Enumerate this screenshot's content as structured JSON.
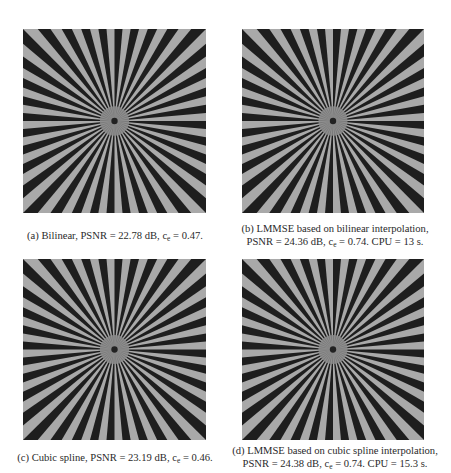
{
  "figure": {
    "panels": [
      {
        "id": "a",
        "image_label": "Siemens star test pattern reconstructed with bilinear interpolation",
        "caption_line1_pre": "(a) Bilinear, PSNR = 22.78 dB, c",
        "caption_line1_sub": "e",
        "caption_line1_post": " = 0.47.",
        "caption_line2_pre": "",
        "caption_line2_sub": "",
        "caption_line2_post": ""
      },
      {
        "id": "b",
        "image_label": "Siemens star test pattern reconstructed with LMMSE based on bilinear interpolation",
        "caption_line1_pre": "(b) LMMSE based on bilinear interpolation,",
        "caption_line1_sub": "",
        "caption_line1_post": "",
        "caption_line2_pre": "PSNR = 24.36 dB, c",
        "caption_line2_sub": "e",
        "caption_line2_post": " = 0.74. CPU = 13 s."
      },
      {
        "id": "c",
        "image_label": "Siemens star test pattern reconstructed with cubic spline interpolation",
        "caption_line1_pre": "(c) Cubic spline, PSNR = 23.19 dB, c",
        "caption_line1_sub": "e",
        "caption_line1_post": " = 0.46.",
        "caption_line2_pre": "",
        "caption_line2_sub": "",
        "caption_line2_post": ""
      },
      {
        "id": "d",
        "image_label": "Siemens star test pattern reconstructed with LMMSE based on cubic spline interpolation",
        "caption_line1_pre": "(d) LMMSE based on cubic spline interpolation,",
        "caption_line1_sub": "",
        "caption_line1_post": "",
        "caption_line2_pre": "PSNR = 24.38 dB, c",
        "caption_line2_sub": "e",
        "caption_line2_post": " = 0.74. CPU = 15.3 s."
      }
    ],
    "pattern": {
      "spokes": 36,
      "dark_color": "#1e1e1e",
      "light_color": "#a9a9a9"
    }
  }
}
